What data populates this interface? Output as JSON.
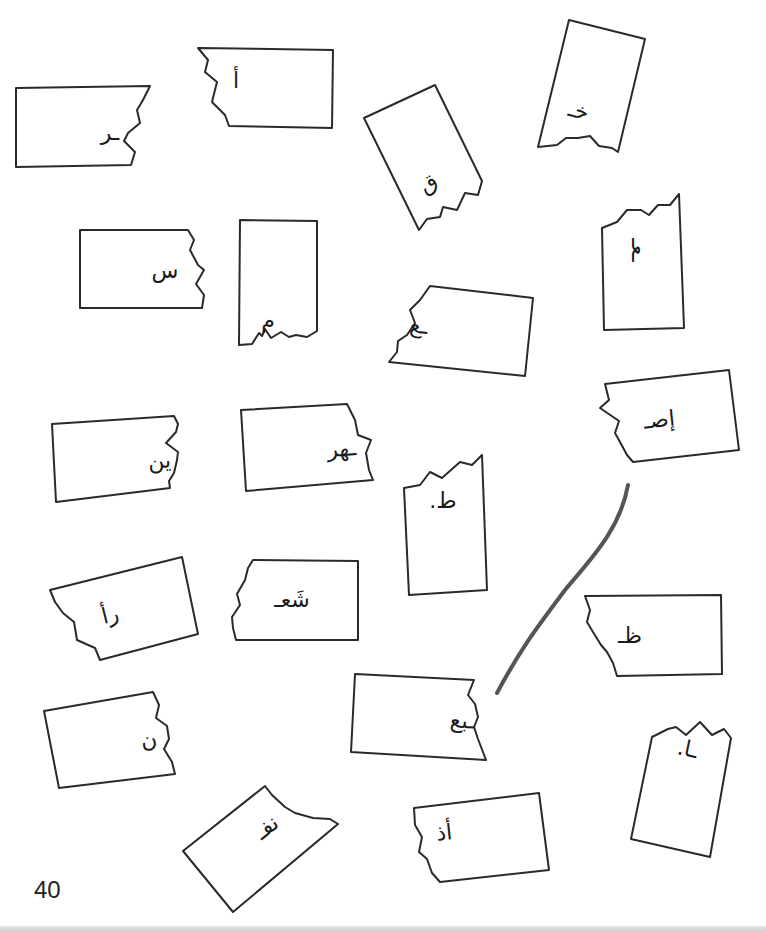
{
  "page": {
    "page_number": "40",
    "instructions": "",
    "line_color": "#555555",
    "card_stroke_color": "#2a2a2a"
  },
  "cards": [
    {
      "id": "c1",
      "text": "ـر",
      "shape": "M16,88 L150,86 L143,100 L137,110 L140,123 L128,133 L124,141 L135,152 L131,165 L16,167 Z",
      "tx": 110,
      "ty": 140,
      "rot": 0
    },
    {
      "id": "c2",
      "text": "أ",
      "shape": "M198,48 L333,50 L332,128 L229,126 L225,115 L212,102 L217,82 L205,72 L208,60 Z",
      "tx": 236,
      "ty": 88,
      "rot": 0
    },
    {
      "id": "c3",
      "text": "ق",
      "shape": "M364,118 L435,85 L482,181 L478,195 L465,193 L457,210 L443,207 L440,217 L427,219 L419,230 Z",
      "tx": 432,
      "ty": 190,
      "rot": -28
    },
    {
      "id": "c4",
      "text": "خـ",
      "shape": "M569,20 L645,39 L618,152 L612,148 L599,146 L590,136 L578,138 L566,138 L557,145 L538,147 Z",
      "tx": 577,
      "ty": 118,
      "rot": 14
    },
    {
      "id": "c5",
      "text": "س",
      "shape": "M80,230 L188,230 L194,240 L190,250 L198,265 L204,270 L196,284 L204,295 L202,308 L80,308 Z",
      "tx": 165,
      "ty": 278,
      "rot": 0
    },
    {
      "id": "c6",
      "text": "م",
      "shape": "M240,220 L317,221 L317,331 L307,337 L296,335 L289,337 L281,332 L271,338 L265,329 L262,336 L259,333 L252,344 L239,345 Z",
      "tx": 268,
      "ty": 328,
      "rot": 0
    },
    {
      "id": "c7",
      "text": "ـع",
      "shape": "M430,286 L533,298 L525,376 L389,362 L397,352 L398,341 L407,335 L415,323 L410,310 L420,300 Z",
      "tx": 418,
      "ty": 333,
      "rot": 7
    },
    {
      "id": "c8",
      "text": "ـعـ",
      "shape": "M602,228 L617,222 L627,210 L641,210 L649,215 L658,205 L670,205 L679,194 L684,328 L604,330 Z",
      "tx": 632,
      "ty": 250,
      "rot": 90
    },
    {
      "id": "c9",
      "text": "ين",
      "shape": "M52,424 L174,416 L178,424 L176,432 L166,443 L178,452 L177,460 L174,473 L169,481 L170,488 L56,502 Z",
      "tx": 160,
      "ty": 468,
      "rot": -4
    },
    {
      "id": "c10",
      "text": "ـهر",
      "shape": "M241,410 L347,404 L355,420 L358,435 L371,440 L366,453 L369,470 L373,480 L246,491 Z",
      "tx": 342,
      "ty": 456,
      "rot": -4
    },
    {
      "id": "c11",
      "text": "إصـ",
      "shape": "M605,384 L729,370 L739,450 L633,462 L627,455 L620,442 L615,433 L619,421 L600,408 L609,400 Z",
      "tx": 660,
      "ty": 427,
      "rot": -6
    },
    {
      "id": "c12",
      "text": "ط.",
      "shape": "M404,488 L420,485 L430,472 L442,478 L460,462 L472,465 L482,455 L487,590 L409,595 Z",
      "tx": 443,
      "ty": 508,
      "rot": 0
    },
    {
      "id": "c13",
      "text": "رأ",
      "shape": "M50,590 L182,557 L198,634 L100,660 L95,648 L77,640 L74,622 L63,613 L55,602 Z",
      "tx": 112,
      "ty": 622,
      "rot": -14
    },
    {
      "id": "c14",
      "text": "شَعـ",
      "shape": "M253,560 L358,561 L358,640 L236,640 L233,628 L232,617 L240,605 L237,594 L245,580 L248,568 Z",
      "tx": 292,
      "ty": 607,
      "rot": 0
    },
    {
      "id": "c15",
      "text": "ظـ",
      "shape": "M585,596 L721,595 L722,674 L617,676 L613,663 L607,652 L601,645 L593,632 L587,622 L590,610 Z",
      "tx": 630,
      "ty": 643,
      "rot": 0
    },
    {
      "id": "c16",
      "text": "ـبع",
      "shape": "M355,674 L474,680 L468,695 L475,704 L478,717 L474,727 L478,739 L486,760 L351,752 Z",
      "tx": 462,
      "ty": 728,
      "rot": 3
    },
    {
      "id": "c17",
      "text": "ن",
      "shape": "M44,711 L153,692 L159,705 L156,718 L167,726 L169,739 L164,749 L172,762 L175,774 L59,788 Z",
      "tx": 150,
      "ty": 747,
      "rot": -10
    },
    {
      "id": "c18",
      "text": "ـا.",
      "shape": "M652,737 L668,729 L676,727 L686,735 L700,722 L712,735 L724,729 L731,738 L710,857 L631,839 Z",
      "tx": 686,
      "ty": 756,
      "rot": 12
    },
    {
      "id": "c19",
      "text": "نفـ",
      "shape": "M183,851 L265,786 L272,795 L285,807 L295,813 L313,818 L330,819 L338,824 L233,912 Z",
      "tx": 271,
      "ty": 833,
      "rot": -38
    },
    {
      "id": "c20",
      "text": "أذ",
      "shape": "M414,808 L539,793 L549,870 L440,882 L432,873 L427,859 L419,852 L422,837 L415,825 Z",
      "tx": 445,
      "ty": 840,
      "rot": -6
    }
  ],
  "match_line": {
    "from": "c11",
    "to": "c16",
    "path": "M628,485 C620,530 590,560 565,590 C535,630 520,650 497,693"
  }
}
